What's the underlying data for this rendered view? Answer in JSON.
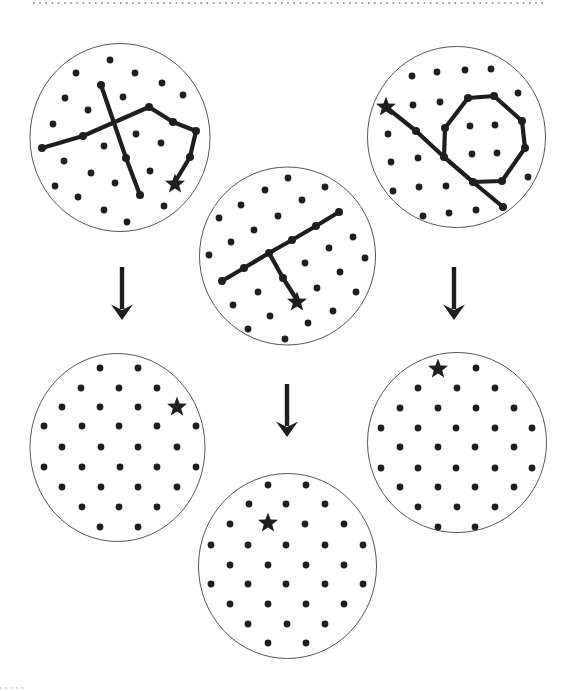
{
  "figure": {
    "width": 579,
    "height": 691,
    "background": "#ffffff",
    "ink_color": "#1e1e1e",
    "circle_outline_color": "#565656",
    "dotted_rule_color": "#9d9d9d",
    "faint_rule_color": "#c9c9c9",
    "dot_radius": 3.4,
    "node_radius": 4.0,
    "line_width": 4.2,
    "circle_outline_width": 1,
    "star_outer_radius": 10.5,
    "top_rule": {
      "x1": 33,
      "x2": 543,
      "y": 3
    },
    "bottom_corner_fragment": {
      "x1": 0,
      "x2": 26,
      "y": 688
    }
  },
  "arrows": [
    {
      "id": "arrow-left",
      "x": 122,
      "y1": 267,
      "y2": 320
    },
    {
      "id": "arrow-middle",
      "x": 287,
      "y1": 384,
      "y2": 437
    },
    {
      "id": "arrow-right",
      "x": 454,
      "y1": 267,
      "y2": 320
    }
  ],
  "circles": [
    {
      "id": "top-left-stimulus",
      "cx": 120,
      "cy": 137.5,
      "rx": 90,
      "ry": 94,
      "dots": [
        [
          110,
          60
        ],
        [
          76,
          73
        ],
        [
          135,
          73
        ],
        [
          162,
          83
        ],
        [
          65,
          98
        ],
        [
          123,
          97
        ],
        [
          183,
          95
        ],
        [
          88,
          110
        ],
        [
          53,
          124
        ],
        [
          136,
          134
        ],
        [
          104,
          146
        ],
        [
          161,
          143
        ],
        [
          64,
          161
        ],
        [
          150,
          171
        ],
        [
          91,
          173
        ],
        [
          115,
          183
        ],
        [
          55,
          186
        ],
        [
          78,
          197
        ],
        [
          164,
          206
        ],
        [
          104,
          210
        ],
        [
          127,
          222
        ]
      ],
      "lines": [
        {
          "points": [
            [
              101,
              85
            ],
            [
              126,
              158
            ],
            [
              140,
              195
            ]
          ],
          "closed": false,
          "nodes": [
            0,
            1,
            2
          ]
        },
        {
          "points": [
            [
              42,
              148
            ],
            [
              83,
              136
            ],
            [
              149,
              107
            ],
            [
              173,
              122
            ],
            [
              196,
              131
            ],
            [
              190,
              157
            ],
            [
              175,
              182
            ]
          ],
          "closed": false,
          "nodes": [
            0,
            1,
            2,
            3,
            4,
            5
          ]
        }
      ],
      "star": {
        "x": 175,
        "y": 184
      }
    },
    {
      "id": "top-middle-stimulus",
      "cx": 287.5,
      "cy": 256,
      "rx": 88,
      "ry": 89,
      "dots": [
        [
          288,
          178
        ],
        [
          265,
          190
        ],
        [
          325,
          187
        ],
        [
          241,
          205
        ],
        [
          302,
          200
        ],
        [
          219,
          218
        ],
        [
          278,
          216
        ],
        [
          254,
          230
        ],
        [
          231,
          242
        ],
        [
          353,
          237
        ],
        [
          209,
          255
        ],
        [
          329,
          248
        ],
        [
          365,
          258
        ],
        [
          305,
          263
        ],
        [
          340,
          272
        ],
        [
          317,
          288
        ],
        [
          356,
          292
        ],
        [
          258,
          292
        ],
        [
          233,
          305
        ],
        [
          270,
          316
        ],
        [
          333,
          311
        ],
        [
          308,
          323
        ],
        [
          248,
          329
        ],
        [
          285,
          339
        ]
      ],
      "lines": [
        {
          "points": [
            [
              222,
              281
            ],
            [
              244,
              268
            ],
            [
              269,
              253
            ],
            [
              292,
              240
            ],
            [
              316,
              226
            ],
            [
              339,
              212
            ]
          ],
          "closed": false,
          "nodes": [
            0,
            1,
            2,
            3,
            4,
            5
          ]
        },
        {
          "points": [
            [
              269,
              253
            ],
            [
              283,
              278
            ],
            [
              297,
              300
            ]
          ],
          "closed": false,
          "nodes": [
            1
          ]
        }
      ],
      "star": {
        "x": 297,
        "y": 302
      }
    },
    {
      "id": "top-right-stimulus",
      "cx": 456.5,
      "cy": 137,
      "rx": 89,
      "ry": 90.5,
      "dots": [
        [
          412,
          76
        ],
        [
          437,
          72
        ],
        [
          465,
          70
        ],
        [
          491,
          69
        ],
        [
          518,
          93
        ],
        [
          413,
          105
        ],
        [
          440,
          102
        ],
        [
          388,
          134
        ],
        [
          391,
          162
        ],
        [
          418,
          158
        ],
        [
          393,
          191
        ],
        [
          419,
          187
        ],
        [
          446,
          186
        ],
        [
          528,
          177
        ],
        [
          423,
          216
        ],
        [
          449,
          213
        ],
        [
          476,
          210
        ],
        [
          470,
          126
        ],
        [
          495,
          125
        ],
        [
          472,
          154
        ],
        [
          497,
          153
        ]
      ],
      "lines": [
        {
          "points": [
            [
              468,
              98
            ],
            [
              494,
              96
            ],
            [
              522,
              121
            ],
            [
              525,
              148
            ],
            [
              502,
              181
            ],
            [
              473,
              182
            ],
            [
              444,
              157
            ],
            [
              445,
              128
            ]
          ],
          "closed": true,
          "nodes": [
            0,
            1,
            2,
            3,
            4,
            5,
            6,
            7
          ]
        },
        {
          "points": [
            [
              386,
              107
            ],
            [
              416,
              131
            ],
            [
              444,
              157
            ],
            [
              473,
              182
            ],
            [
              503,
              207
            ]
          ],
          "closed": false,
          "nodes": [
            1,
            4
          ]
        }
      ],
      "star": {
        "x": 386,
        "y": 107
      }
    },
    {
      "id": "bottom-left-response",
      "cx": 117.5,
      "cy": 447.5,
      "rx": 87.5,
      "ry": 94,
      "dots": [
        [
          100,
          368
        ],
        [
          138,
          368
        ],
        [
          81,
          388
        ],
        [
          119,
          388
        ],
        [
          157,
          388
        ],
        [
          62,
          407
        ],
        [
          100,
          407
        ],
        [
          138,
          407
        ],
        [
          44,
          426
        ],
        [
          82,
          426
        ],
        [
          119,
          426
        ],
        [
          157,
          426
        ],
        [
          196,
          426
        ],
        [
          62,
          447
        ],
        [
          101,
          447
        ],
        [
          138,
          447
        ],
        [
          177,
          447
        ],
        [
          44,
          467
        ],
        [
          82,
          467
        ],
        [
          120,
          467
        ],
        [
          157,
          467
        ],
        [
          196,
          467
        ],
        [
          62,
          487
        ],
        [
          101,
          487
        ],
        [
          138,
          487
        ],
        [
          177,
          487
        ],
        [
          82,
          507
        ],
        [
          119,
          507
        ],
        [
          157,
          507
        ],
        [
          100,
          527
        ],
        [
          138,
          527
        ]
      ],
      "lines": [],
      "star": {
        "x": 177,
        "y": 407
      }
    },
    {
      "id": "bottom-middle-response",
      "cx": 287.5,
      "cy": 566,
      "rx": 89,
      "ry": 92.5,
      "dots": [
        [
          268,
          485
        ],
        [
          306,
          485
        ],
        [
          249,
          504
        ],
        [
          286,
          504
        ],
        [
          325,
          504
        ],
        [
          230,
          524
        ],
        [
          305,
          524
        ],
        [
          344,
          524
        ],
        [
          211,
          545
        ],
        [
          248,
          545
        ],
        [
          286,
          545
        ],
        [
          325,
          545
        ],
        [
          363,
          545
        ],
        [
          230,
          565
        ],
        [
          268,
          565
        ],
        [
          306,
          565
        ],
        [
          344,
          565
        ],
        [
          211,
          584
        ],
        [
          248,
          584
        ],
        [
          286,
          584
        ],
        [
          325,
          584
        ],
        [
          363,
          584
        ],
        [
          230,
          604
        ],
        [
          268,
          604
        ],
        [
          306,
          604
        ],
        [
          344,
          604
        ],
        [
          248,
          624
        ],
        [
          287,
          624
        ],
        [
          325,
          624
        ],
        [
          268,
          643
        ],
        [
          306,
          643
        ]
      ],
      "lines": [],
      "star": {
        "x": 268,
        "y": 523
      }
    },
    {
      "id": "bottom-right-response",
      "cx": 457,
      "cy": 442.5,
      "rx": 89.5,
      "ry": 90,
      "dots": [
        [
          476,
          368
        ],
        [
          418,
          388
        ],
        [
          457,
          388
        ],
        [
          495,
          388
        ],
        [
          400,
          408
        ],
        [
          438,
          408
        ],
        [
          476,
          408
        ],
        [
          514,
          408
        ],
        [
          381,
          428
        ],
        [
          418,
          428
        ],
        [
          456,
          428
        ],
        [
          495,
          428
        ],
        [
          532,
          428
        ],
        [
          400,
          447
        ],
        [
          438,
          447
        ],
        [
          475,
          447
        ],
        [
          514,
          447
        ],
        [
          381,
          468
        ],
        [
          418,
          468
        ],
        [
          456,
          468
        ],
        [
          495,
          468
        ],
        [
          532,
          468
        ],
        [
          400,
          487
        ],
        [
          438,
          487
        ],
        [
          475,
          487
        ],
        [
          514,
          487
        ],
        [
          418,
          507
        ],
        [
          457,
          507
        ],
        [
          495,
          507
        ],
        [
          438,
          527
        ],
        [
          475,
          527
        ]
      ],
      "lines": [],
      "star": {
        "x": 438,
        "y": 369
      }
    }
  ]
}
